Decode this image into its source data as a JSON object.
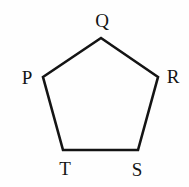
{
  "diagram": {
    "shape": "pentagon",
    "stroke_color": "#141414",
    "background": "#fefefe",
    "vertex_labels": {
      "top": "Q",
      "left": "P",
      "right": "R",
      "bottom_left": "T",
      "bottom_right": "S"
    }
  }
}
